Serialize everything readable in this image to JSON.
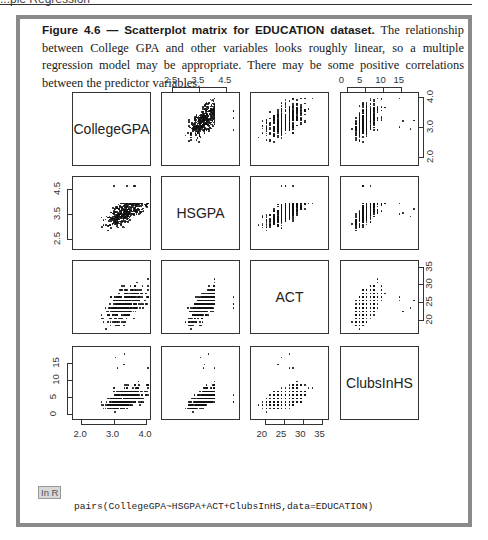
{
  "page_header": {
    "text": "...ple Regression"
  },
  "figure": {
    "title": "Figure 4.6 — Scatterplot matrix for EDUCATION dataset.",
    "caption": " The relationship between College GPA and other variables looks roughly linear, so a multiple regression model may be appropriate. There may be some positive correlations between the predictor variables."
  },
  "code_block": {
    "badge": "In R",
    "code": "pairs(CollegeGPA~HSGPA+ACT+ClubsInHS,data=EDUCATION)"
  },
  "chart_data": {
    "type": "scatter",
    "subtype": "scatterplot_matrix",
    "title": "Scatterplot matrix for EDUCATION dataset",
    "variables": [
      "CollegeGPA",
      "HSGPA",
      "ACT",
      "ClubsInHS"
    ],
    "axes": {
      "CollegeGPA": {
        "ticks": [
          2.0,
          3.0,
          4.0
        ],
        "tick_labels": [
          "2.0",
          "3.0",
          "4.0"
        ],
        "range": [
          1.8,
          4.05
        ]
      },
      "HSGPA": {
        "ticks": [
          2.5,
          3.5,
          4.5
        ],
        "tick_labels": [
          "2.5",
          "3.5",
          "4.5"
        ],
        "range": [
          2.2,
          4.9
        ]
      },
      "ACT": {
        "ticks": [
          20,
          25,
          30,
          35
        ],
        "tick_labels": [
          "20",
          "25",
          "30",
          "35"
        ],
        "range": [
          17,
          36
        ]
      },
      "ClubsInHS": {
        "ticks": [
          0,
          5,
          10,
          15
        ],
        "tick_labels": [
          "0",
          "5",
          "10",
          "15"
        ],
        "range": [
          -1,
          19
        ]
      }
    },
    "tick_positions": {
      "top": [
        {
          "panel_col": 2,
          "variable": "HSGPA"
        },
        {
          "panel_col": 4,
          "variable": "ClubsInHS"
        }
      ],
      "right": [
        {
          "panel_row": 1,
          "variable": "CollegeGPA"
        },
        {
          "panel_row": 3,
          "variable": "ACT"
        }
      ],
      "left": [
        {
          "panel_row": 2,
          "variable": "HSGPA"
        },
        {
          "panel_row": 4,
          "variable": "ClubsInHS"
        }
      ],
      "bottom": [
        {
          "panel_col": 1,
          "variable": "CollegeGPA"
        },
        {
          "panel_col": 3,
          "variable": "ACT"
        }
      ]
    },
    "grid": false,
    "legend": null
  },
  "labels": {
    "diag": [
      "CollegeGPA",
      "HSGPA",
      "ACT",
      "ClubsInHS"
    ],
    "top_ticks_hsgpa": [
      "2.5",
      "3.5",
      "4.5"
    ],
    "top_ticks_clubs": [
      "0",
      "5",
      "10",
      "15"
    ],
    "right_ticks_college": [
      "4.0",
      "3.0",
      "2.0"
    ],
    "right_ticks_act": [
      "35",
      "30",
      "25",
      "20"
    ],
    "left_ticks_hsgpa": [
      "4.5",
      "3.5",
      "2.5"
    ],
    "left_ticks_clubs": [
      "15",
      "10",
      "5",
      "0"
    ],
    "bottom_ticks_college": [
      "2.0",
      "3.0",
      "4.0"
    ],
    "bottom_ticks_act": [
      "20",
      "25",
      "30",
      "35"
    ]
  }
}
